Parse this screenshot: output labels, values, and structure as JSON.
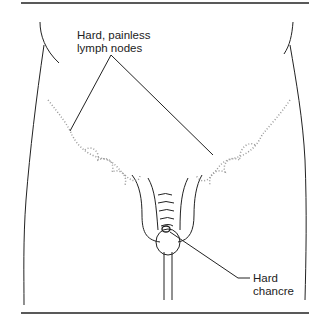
{
  "diagram": {
    "labels": {
      "lymph_nodes_line1": "Hard, painless",
      "lymph_nodes_line2": "lymph nodes",
      "chancre_line1": "Hard",
      "chancre_line2": "chancre"
    },
    "colors": {
      "stroke": "#222222",
      "stipple": "#888888",
      "background": "#ffffff"
    }
  }
}
